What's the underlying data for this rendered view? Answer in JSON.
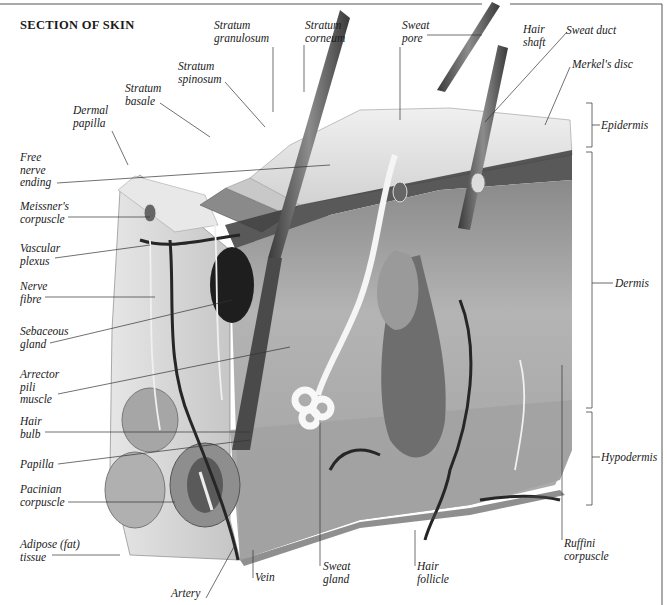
{
  "title": "SECTION OF SKIN",
  "labels": {
    "stratum_granulosum": "Stratum\ngranulosum",
    "stratum_corneum": "Stratum\ncorneum",
    "sweat_pore": "Sweat\npore",
    "hair_shaft": "Hair\nshaft",
    "sweat_duct": "Sweat duct",
    "merkels_disc": "Merkel's disc",
    "stratum_spinosum": "Stratum\nspinosum",
    "stratum_basale": "Stratum\nbasale",
    "dermal_papilla": "Dermal\npapilla",
    "free_nerve_ending": "Free\nnerve\nending",
    "meissners_corpuscle": "Meissner's\ncorpuscle",
    "vascular_plexus": "Vascular\nplexus",
    "nerve_fibre": "Nerve\nfibre",
    "sebaceous_gland": "Sebaceous\ngland",
    "arrector_pili_muscle": "Arrector\npili\nmuscle",
    "hair_bulb": "Hair\nbulb",
    "papilla": "Papilla",
    "pacinian_corpuscle": "Pacinian\ncorpuscle",
    "adipose_tissue": "Adipose (fat)\ntissue",
    "artery": "Artery",
    "vein": "Vein",
    "sweat_gland": "Sweat\ngland",
    "hair_follicle": "Hair\nfollicle",
    "ruffini_corpuscle": "Ruffini\ncorpuscle"
  },
  "layers": {
    "epidermis": "Epidermis",
    "dermis": "Dermis",
    "hypodermis": "Hypodermis"
  },
  "colors": {
    "text": "#1a1a1a",
    "leader": "#333333",
    "skin_surface": "#e4e4e4",
    "dermis": "#bdbdbd",
    "hypodermis": "#a8a8a8",
    "vessel": "#2a2a2a",
    "nerve": "#f2f2f2"
  }
}
